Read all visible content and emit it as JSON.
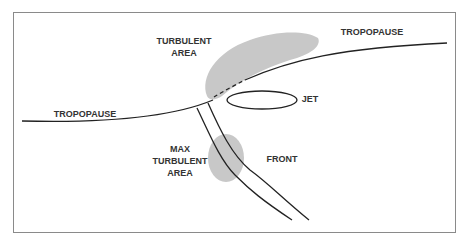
{
  "diagram": {
    "type": "jet stream turbulence cross-section",
    "labels": {
      "turbulent_area_line1": "TURBULENT",
      "turbulent_area_line2": "AREA",
      "tropopause_right": "TROPOPAUSE",
      "tropopause_left": "TROPOPAUSE",
      "jet": "JET",
      "max_turbulent_line1": "MAX",
      "max_turbulent_line2": "TURBULENT",
      "max_turbulent_line3": "AREA",
      "front": "FRONT"
    },
    "colors": {
      "line": "#222222",
      "shade": "#c8c8c8",
      "frame": "#8a8a8a",
      "text": "#333333"
    }
  }
}
